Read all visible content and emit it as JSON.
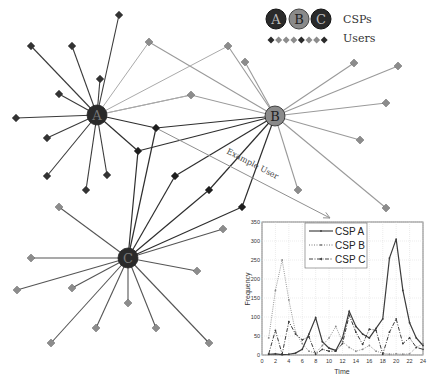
{
  "legend": {
    "csp_labels": [
      "A",
      "B",
      "C"
    ],
    "csp_text": "CSPs",
    "users_text": "Users"
  },
  "example_user_label": "Example User",
  "csps": [
    {
      "id": "A",
      "x": 97,
      "y": 115,
      "fill": "#2a2a2a",
      "edge_color": "#3a3a3a"
    },
    {
      "id": "B",
      "x": 275,
      "y": 116,
      "fill": "#8a8a8a",
      "edge_color": "#9a9a9a"
    },
    {
      "id": "C",
      "x": 128,
      "y": 258,
      "fill": "#2a2a2a",
      "edge_color": "#555555"
    }
  ],
  "users": {
    "A": [
      [
        119,
        15
      ],
      [
        31,
        46
      ],
      [
        72,
        46
      ],
      [
        100,
        79
      ],
      [
        59,
        94
      ],
      [
        16,
        118
      ],
      [
        47,
        138
      ],
      [
        47,
        176
      ],
      [
        107,
        175
      ],
      [
        86,
        190
      ]
    ],
    "B": [
      [
        149,
        42
      ],
      [
        228,
        46
      ],
      [
        245,
        62
      ],
      [
        354,
        63
      ],
      [
        398,
        66
      ],
      [
        386,
        103
      ],
      [
        360,
        140
      ],
      [
        298,
        190
      ],
      [
        386,
        208
      ]
    ],
    "C": [
      [
        59,
        207
      ],
      [
        31,
        258
      ],
      [
        72,
        288
      ],
      [
        17,
        290
      ],
      [
        128,
        303
      ],
      [
        197,
        271
      ],
      [
        223,
        229
      ],
      [
        96,
        328
      ],
      [
        156,
        328
      ],
      [
        51,
        343
      ],
      [
        209,
        343
      ]
    ],
    "AB": [
      [
        191,
        95
      ]
    ],
    "shared_dark": [
      {
        "x": 156,
        "y": 128,
        "links": [
          "A",
          "B",
          "C"
        ]
      },
      {
        "x": 138,
        "y": 151,
        "links": [
          "A",
          "B",
          "C"
        ]
      },
      {
        "x": 175,
        "y": 176,
        "links": [
          "B",
          "C"
        ]
      },
      {
        "x": 209,
        "y": 190,
        "links": [
          "B",
          "C"
        ]
      },
      {
        "x": 242,
        "y": 207,
        "links": [
          "B",
          "C"
        ]
      }
    ],
    "B_to_A_links": [
      [
        149,
        42
      ],
      [
        191,
        95
      ],
      [
        228,
        46
      ]
    ]
  },
  "example_user": {
    "from": [
      156,
      128
    ],
    "to": [
      330,
      218
    ],
    "label": "Example User"
  },
  "chart_data": {
    "type": "line",
    "title": "",
    "xlabel": "Time",
    "ylabel": "Frequency",
    "xlim": [
      0,
      24
    ],
    "ylim": [
      0,
      350
    ],
    "xticks": [
      0,
      2,
      4,
      6,
      8,
      10,
      12,
      14,
      16,
      18,
      20,
      22,
      24
    ],
    "yticks": [
      0,
      50,
      100,
      150,
      200,
      250,
      300,
      350
    ],
    "grid": true,
    "legend_position": "upper center",
    "x": [
      1,
      2,
      3,
      4,
      5,
      6,
      7,
      8,
      9,
      10,
      11,
      12,
      13,
      14,
      15,
      16,
      17,
      18,
      19,
      20,
      21,
      22,
      23,
      24
    ],
    "series": [
      {
        "name": "CSP A",
        "style": "solid",
        "values": [
          2,
          3,
          1,
          2,
          5,
          15,
          55,
          98,
          35,
          18,
          12,
          45,
          115,
          75,
          55,
          45,
          70,
          95,
          255,
          305,
          170,
          85,
          45,
          25
        ]
      },
      {
        "name": "CSP B",
        "style": "dotted",
        "values": [
          45,
          170,
          250,
          145,
          60,
          30,
          10,
          5,
          25,
          45,
          75,
          35,
          20,
          10,
          15,
          25,
          10,
          5,
          2,
          3,
          2,
          3,
          20,
          30
        ]
      },
      {
        "name": "CSP C",
        "style": "dashdot",
        "values": [
          3,
          65,
          2,
          88,
          55,
          40,
          48,
          2,
          15,
          10,
          10,
          30,
          105,
          60,
          28,
          68,
          65,
          2,
          60,
          95,
          30,
          45,
          20,
          15
        ]
      }
    ]
  }
}
